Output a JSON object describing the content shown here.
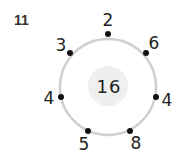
{
  "question_number": "11",
  "center_value": "16",
  "colors": {
    "ring": "#cfcfcf",
    "inner": "#efefef",
    "dot": "#111111",
    "text": "#222222"
  },
  "nodes": [
    {
      "label": "2",
      "dot": [
        108,
        34
      ],
      "text": [
        108,
        20
      ]
    },
    {
      "label": "6",
      "dot": [
        146,
        53
      ],
      "text": [
        154,
        43
      ]
    },
    {
      "label": "4",
      "dot": [
        156,
        97
      ],
      "text": [
        167,
        100
      ]
    },
    {
      "label": "8",
      "dot": [
        130,
        131
      ],
      "text": [
        136,
        143
      ]
    },
    {
      "label": "5",
      "dot": [
        88,
        131
      ],
      "text": [
        84,
        144
      ]
    },
    {
      "label": "4",
      "dot": [
        61,
        97
      ],
      "text": [
        49,
        98
      ]
    },
    {
      "label": "3",
      "dot": [
        70,
        53
      ],
      "text": [
        61,
        45
      ]
    }
  ]
}
